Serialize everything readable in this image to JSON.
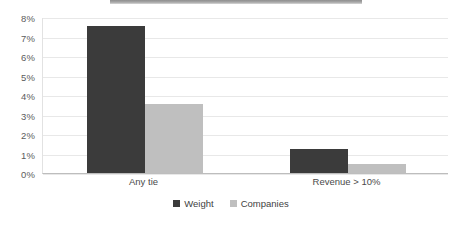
{
  "chart_data": {
    "type": "bar",
    "title": "",
    "subtitle": "",
    "xlabel": "",
    "ylabel": "",
    "categories": [
      "Any tie",
      "Revenue > 10%"
    ],
    "series": [
      {
        "name": "Weight",
        "color": "#3b3b3b",
        "values": [
          7.55,
          1.22
        ]
      },
      {
        "name": "Companies",
        "color": "#bfbfbf",
        "values": [
          3.55,
          0.48
        ]
      }
    ],
    "ylim": [
      0,
      8
    ],
    "ytick_values": [
      0,
      1,
      2,
      3,
      4,
      5,
      6,
      7,
      8
    ],
    "ytick_labels": [
      "0%",
      "1%",
      "2%",
      "3%",
      "4%",
      "5%",
      "6%",
      "7%",
      "8%"
    ],
    "grid": true,
    "grid_axis": "y",
    "legend_position": "bottom",
    "value_unit": "percent"
  },
  "legend": {
    "items": [
      {
        "label": "Weight",
        "swatch": "legend-swatch-weight"
      },
      {
        "label": "Companies",
        "swatch": "legend-swatch-companies"
      }
    ]
  },
  "decorations": {
    "top_strip": ""
  }
}
